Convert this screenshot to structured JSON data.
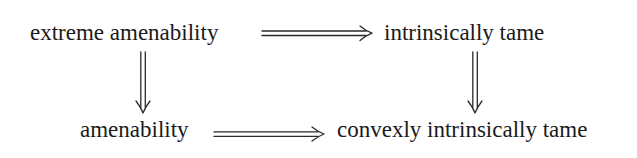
{
  "diagram": {
    "type": "commutative-implication-diagram",
    "nodes": [
      {
        "id": "extreme_amenability",
        "label": "extreme amenability"
      },
      {
        "id": "intrinsically_tame",
        "label": "intrinsically tame"
      },
      {
        "id": "amenability",
        "label": "amenability"
      },
      {
        "id": "convexly_intrinsically_tame",
        "label": "convexly intrinsically tame"
      }
    ],
    "edges": [
      {
        "from": "extreme_amenability",
        "to": "intrinsically_tame",
        "style": "double-arrow-right"
      },
      {
        "from": "extreme_amenability",
        "to": "amenability",
        "style": "double-arrow-down"
      },
      {
        "from": "intrinsically_tame",
        "to": "convexly_intrinsically_tame",
        "style": "double-arrow-down"
      },
      {
        "from": "amenability",
        "to": "convexly_intrinsically_tame",
        "style": "double-arrow-right"
      }
    ],
    "colors": {
      "text": "#1a1a1a",
      "arrow": "#2a2a2a",
      "background": "#ffffff"
    }
  }
}
